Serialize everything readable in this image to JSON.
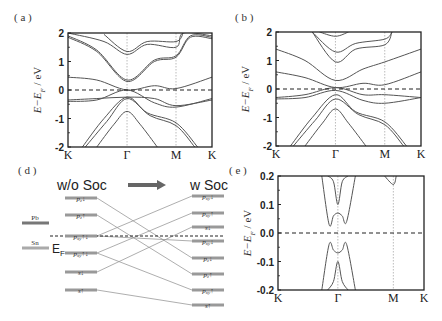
{
  "figure": {
    "panels": {
      "a": {
        "label": "( a )"
      },
      "b": {
        "label": "( b )"
      },
      "d": {
        "label": "( d )"
      },
      "e": {
        "label": "( e )"
      }
    },
    "diagram_d": {
      "left_title": "w/o Soc",
      "right_title": "w Soc",
      "ef_label": "E",
      "ef_sub": "F",
      "atoms": [
        {
          "label": "Pb",
          "y": 223
        },
        {
          "label": "Sn",
          "y": 248
        }
      ],
      "left_levels": [
        {
          "label": "p",
          "sub": "z",
          "spin": "↓",
          "y": 198
        },
        {
          "label": "p",
          "sub": "z",
          "spin": "↑",
          "y": 215
        },
        {
          "label": "p",
          "sub": "xy",
          "spin": "↑↓",
          "y": 236
        },
        {
          "label": "p",
          "sub": "xy",
          "spin": "↑↓",
          "y": 253
        },
        {
          "label": "s",
          "sub": "",
          "spin": "↓",
          "y": 272
        },
        {
          "label": "s",
          "sub": "",
          "spin": "↑",
          "y": 290
        }
      ],
      "right_levels": [
        {
          "label": "p",
          "sub": "xy",
          "spin": "↓",
          "y": 196
        },
        {
          "label": "p",
          "sub": "xy",
          "spin": "↑",
          "y": 213
        },
        {
          "label": "s",
          "sub": "",
          "spin": "↓",
          "y": 227
        },
        {
          "label": "p",
          "sub": "xy",
          "spin": "↓",
          "y": 241
        },
        {
          "label": "p",
          "sub": "z",
          "spin": "↓",
          "y": 258
        },
        {
          "label": "p",
          "sub": "z",
          "spin": "↑",
          "y": 274
        },
        {
          "label": "p",
          "sub": "xy",
          "spin": "↑",
          "y": 290
        },
        {
          "label": "s",
          "sub": "",
          "spin": "↑",
          "y": 305
        }
      ],
      "connections": [
        [
          0,
          4
        ],
        [
          1,
          5
        ],
        [
          2,
          0
        ],
        [
          2,
          3
        ],
        [
          3,
          1
        ],
        [
          3,
          6
        ],
        [
          4,
          2
        ],
        [
          5,
          7
        ]
      ]
    }
  },
  "chart_data": [
    {
      "panel": "a",
      "type": "line",
      "title": "",
      "xlabel": "",
      "ylabel": "E−E_F / eV",
      "ylim": [
        -2,
        2
      ],
      "yticks": [
        "2",
        "1",
        "0",
        "-1",
        "-2"
      ],
      "xticks": [
        "K",
        "Γ",
        "M",
        "K"
      ],
      "xtick_pos": [
        0,
        0.41,
        0.75,
        1.0
      ],
      "fermi_line": 0,
      "series": [
        {
          "name": "band1",
          "x": [
            0,
            0.2,
            0.41,
            0.6,
            0.75,
            1
          ],
          "y": [
            0.45,
            0.35,
            0.0,
            0.15,
            0.05,
            0.45
          ]
        },
        {
          "name": "band2",
          "x": [
            0,
            0.2,
            0.41,
            0.6,
            0.75,
            1
          ],
          "y": [
            -0.4,
            -0.35,
            0.0,
            -0.45,
            -0.6,
            -0.3
          ]
        },
        {
          "name": "band3",
          "x": [
            0,
            0.2,
            0.41,
            0.6,
            0.75,
            1
          ],
          "y": [
            -0.35,
            -0.3,
            -0.25,
            -0.3,
            -0.55,
            -0.35
          ]
        },
        {
          "name": "band4",
          "x": [
            0.1,
            0.25,
            0.41,
            0.55,
            0.75,
            0.9
          ],
          "y": [
            -2,
            -1.0,
            -0.25,
            -0.8,
            -1.15,
            -2
          ]
        },
        {
          "name": "band5",
          "x": [
            0.12,
            0.27,
            0.41,
            0.57,
            0.75,
            0.88
          ],
          "y": [
            -2,
            -1.1,
            -0.3,
            -0.9,
            -1.25,
            -2
          ]
        },
        {
          "name": "band6",
          "x": [
            0.2,
            0.32,
            0.41,
            0.5,
            0.62
          ],
          "y": [
            -2,
            -1.2,
            -0.75,
            -1.2,
            -2
          ]
        },
        {
          "name": "band7",
          "x": [
            0,
            0.2,
            0.41,
            0.6,
            0.75,
            0.85,
            1
          ],
          "y": [
            1.9,
            1.4,
            0.35,
            1.05,
            1.2,
            1.9,
            1.85
          ]
        },
        {
          "name": "band8",
          "x": [
            0,
            0.2,
            0.41,
            0.6,
            0.75,
            0.85,
            1
          ],
          "y": [
            1.85,
            1.35,
            0.3,
            1.0,
            1.15,
            1.85,
            1.8
          ]
        },
        {
          "name": "band9",
          "x": [
            0,
            0.25,
            0.41,
            0.55,
            0.75,
            0.8,
            1
          ],
          "y": [
            2.0,
            1.7,
            1.25,
            1.6,
            1.5,
            2.0,
            1.9
          ]
        },
        {
          "name": "band10",
          "x": [
            0.25,
            0.41,
            0.55,
            0.75,
            0.8
          ],
          "y": [
            1.95,
            1.35,
            1.7,
            1.7,
            2.0
          ]
        }
      ]
    },
    {
      "panel": "b",
      "type": "line",
      "title": "",
      "xlabel": "",
      "ylabel": "E−E_F / eV",
      "ylim": [
        -2,
        2
      ],
      "yticks": [
        "2",
        "1",
        "0",
        "-1",
        "-2"
      ],
      "xticks": [
        "K",
        "Γ",
        "M",
        "K"
      ],
      "xtick_pos": [
        0,
        0.41,
        0.75,
        1.0
      ],
      "fermi_line": 0,
      "series": [
        {
          "name": "band1",
          "x": [
            0,
            0.2,
            0.41,
            0.6,
            0.75,
            1
          ],
          "y": [
            1.4,
            1.0,
            0.3,
            0.7,
            0.95,
            1.4
          ]
        },
        {
          "name": "band2",
          "x": [
            0,
            0.2,
            0.41,
            0.6,
            0.75,
            1
          ],
          "y": [
            0.6,
            0.4,
            0.05,
            0.2,
            0.15,
            0.6
          ]
        },
        {
          "name": "band3",
          "x": [
            0,
            0.2,
            0.41,
            0.6,
            0.75,
            1
          ],
          "y": [
            -0.35,
            -0.3,
            -0.05,
            -0.4,
            -0.5,
            -0.3
          ]
        },
        {
          "name": "band4",
          "x": [
            0,
            0.2,
            0.41,
            0.6,
            0.75,
            1
          ],
          "y": [
            -0.3,
            -0.2,
            0.05,
            -0.2,
            -0.2,
            -0.3
          ]
        },
        {
          "name": "band5",
          "x": [
            0.1,
            0.25,
            0.41,
            0.55,
            0.75,
            0.9
          ],
          "y": [
            -2,
            -1.0,
            -0.2,
            -0.8,
            -1.15,
            -2
          ]
        },
        {
          "name": "band6",
          "x": [
            0.12,
            0.27,
            0.41,
            0.57,
            0.75,
            0.88
          ],
          "y": [
            -2,
            -1.1,
            -0.35,
            -0.9,
            -1.25,
            -2
          ]
        },
        {
          "name": "band7",
          "x": [
            0.2,
            0.32,
            0.41,
            0.5,
            0.62
          ],
          "y": [
            -2,
            -1.2,
            -0.7,
            -1.2,
            -2
          ]
        },
        {
          "name": "band8",
          "x": [
            0.25,
            0.41,
            0.55,
            0.75,
            0.8
          ],
          "y": [
            2.0,
            0.95,
            1.4,
            1.55,
            2.0
          ]
        },
        {
          "name": "band9",
          "x": [
            0.25,
            0.41,
            0.55,
            0.75,
            0.8
          ],
          "y": [
            2.0,
            1.3,
            1.6,
            1.75,
            2.0
          ]
        },
        {
          "name": "band10",
          "x": [
            0.3,
            0.41,
            0.5
          ],
          "y": [
            2.0,
            1.85,
            2.0
          ]
        }
      ]
    },
    {
      "panel": "e",
      "type": "line",
      "title": "",
      "xlabel": "",
      "ylabel": "E−E_F / eV",
      "ylim": [
        -0.2,
        0.2
      ],
      "yticks": [
        "0.2",
        "0.1",
        "0.0",
        "-0.1",
        "-0.2"
      ],
      "xticks": [
        "K",
        "Γ",
        "M",
        "K"
      ],
      "xtick_pos": [
        0,
        0.41,
        0.79,
        1.0
      ],
      "fermi_line": 0.0,
      "series": [
        {
          "name": "cb1",
          "x": [
            0.3,
            0.35,
            0.38,
            0.41,
            0.44,
            0.47,
            0.53
          ],
          "y": [
            0.2,
            0.03,
            0.06,
            0.07,
            0.06,
            0.04,
            0.2
          ]
        },
        {
          "name": "cb2",
          "x": [
            0.34,
            0.38,
            0.41,
            0.44,
            0.48
          ],
          "y": [
            0.2,
            0.18,
            0.1,
            0.18,
            0.2
          ]
        },
        {
          "name": "cb3",
          "x": [
            0.73,
            0.79,
            0.81
          ],
          "y": [
            0.2,
            0.17,
            0.2
          ]
        },
        {
          "name": "vb1",
          "x": [
            0.3,
            0.35,
            0.38,
            0.41,
            0.44,
            0.47,
            0.53
          ],
          "y": [
            -0.2,
            -0.04,
            -0.06,
            -0.07,
            -0.06,
            -0.04,
            -0.2
          ]
        },
        {
          "name": "vb2",
          "x": [
            0.34,
            0.38,
            0.41,
            0.44,
            0.48
          ],
          "y": [
            -0.2,
            -0.17,
            -0.1,
            -0.17,
            -0.2
          ]
        }
      ]
    }
  ]
}
